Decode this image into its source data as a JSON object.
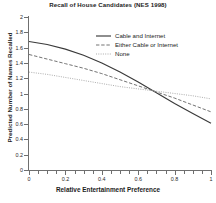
{
  "chart_data": {
    "type": "line",
    "title": "Recall of House Candidates (NES 1998)",
    "xlabel": "Relative Entertainment Preference",
    "ylabel": "Predicted Number of Names Recalled",
    "xlim": [
      0,
      1
    ],
    "ylim": [
      0,
      2
    ],
    "grid": false,
    "legend_position": "top-right",
    "xticks": [
      0,
      0.2,
      0.4,
      0.6,
      0.8,
      1
    ],
    "xticklabels": [
      "0",
      "0.2",
      "0.4",
      "0.6",
      "0.8",
      "1"
    ],
    "xminor_tick_step": 0.05,
    "yticks": [
      0,
      0.2,
      0.4,
      0.6,
      0.8,
      1,
      1.2,
      1.4,
      1.6,
      1.8,
      2
    ],
    "yticklabels": [
      "0",
      "0.2",
      "0.4",
      "0.6",
      "0.8",
      "1",
      "1.2",
      "1.4",
      "1.6",
      "1.8",
      "2"
    ],
    "x": [
      0,
      0.1,
      0.2,
      0.3,
      0.4,
      0.5,
      0.6,
      0.7,
      0.8,
      0.9,
      1
    ],
    "series": [
      {
        "name": "Cable and Internet",
        "style": "solid",
        "color": "#3a3a3a",
        "values": [
          1.68,
          1.64,
          1.58,
          1.5,
          1.4,
          1.28,
          1.15,
          1.01,
          0.87,
          0.74,
          0.61
        ]
      },
      {
        "name": "Either Cable or Internet",
        "style": "dashed",
        "color": "#6b6b6b",
        "values": [
          1.51,
          1.45,
          1.39,
          1.33,
          1.26,
          1.18,
          1.1,
          1.02,
          0.94,
          0.85,
          0.76
        ]
      },
      {
        "name": "None",
        "style": "dotted",
        "color": "#a8a8a8",
        "values": [
          1.28,
          1.25,
          1.21,
          1.17,
          1.13,
          1.09,
          1.06,
          1.03,
          1.0,
          0.97,
          0.93
        ]
      }
    ]
  }
}
